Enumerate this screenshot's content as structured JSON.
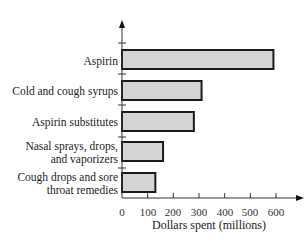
{
  "chart_data": {
    "type": "bar",
    "orientation": "horizontal",
    "title": "",
    "xlabel": "Dollars spent (millions)",
    "ylabel": "",
    "categories": [
      "Aspirin",
      "Cold and cough syrups",
      "Aspirin substitutes",
      "Nasal sprays, drops, and vaporizers",
      "Cough drops and sore throat remedies"
    ],
    "values": [
      590,
      310,
      280,
      160,
      130
    ],
    "xlim": [
      0,
      600
    ],
    "xticks": [
      0,
      100,
      200,
      300,
      400,
      500,
      600
    ],
    "grid": false,
    "legend": null,
    "colors": {
      "bar_fill": "#d4d4d4",
      "bar_stroke": "#1a1a1a",
      "axis": "#333333"
    }
  },
  "labels": {
    "categories_display": [
      "Aspirin",
      "Cold and cough syrups",
      "Aspirin substitutes",
      "Nasal sprays, drops,\nand vaporizers",
      "Cough drops and sore\nthroat remedies"
    ],
    "xticks": [
      "0",
      "100",
      "200",
      "300",
      "400",
      "500",
      "600"
    ],
    "xlabel": "Dollars spent (millions)"
  }
}
